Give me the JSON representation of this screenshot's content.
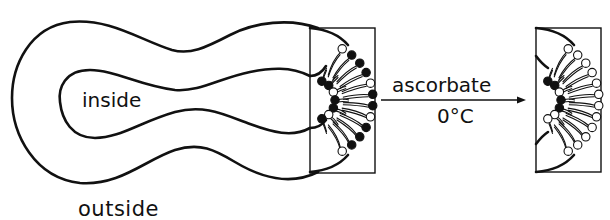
{
  "diagram": {
    "labels": {
      "inside": "inside",
      "outside": "outside",
      "reagent": "ascorbate",
      "temperature": "0°C"
    },
    "colors": {
      "ink": "#111111",
      "background": "#ffffff",
      "open_headgroup": "#ffffff",
      "filled_headgroup": "#111111"
    },
    "panels": [
      {
        "name": "before",
        "description": "membrane bilayer segment before treatment",
        "outer_leaflet_heads": [
          "open",
          "filled",
          "filled",
          "filled",
          "open",
          "filled",
          "filled",
          "open",
          "filled",
          "filled",
          "filled",
          "open"
        ],
        "inner_leaflet_heads": [
          "filled",
          "filled",
          "open",
          "filled",
          "filled",
          "open",
          "filled"
        ]
      },
      {
        "name": "after",
        "description": "membrane bilayer segment after ascorbate at 0°C",
        "outer_leaflet_heads": [
          "open",
          "open",
          "open",
          "open",
          "open",
          "open",
          "open",
          "open",
          "open",
          "open",
          "open",
          "open"
        ],
        "inner_leaflet_heads": [
          "filled",
          "filled",
          "open",
          "filled",
          "filled",
          "open",
          "open"
        ]
      }
    ]
  }
}
